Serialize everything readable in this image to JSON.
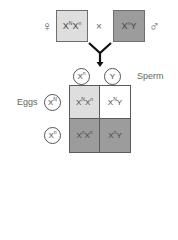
{
  "parents": {
    "female": {
      "symbol": "♀",
      "genotype_base1": "X",
      "genotype_sup1": "N",
      "genotype_base2": "X",
      "genotype_sup2": "n",
      "color": "#dedede"
    },
    "cross_symbol": "×",
    "male": {
      "symbol": "♂",
      "genotype_base1": "X",
      "genotype_sup1": "n",
      "genotype_base2": "Y",
      "color": "#9c9c9c"
    }
  },
  "sperm": {
    "label": "Sperm",
    "gametes": [
      {
        "base": "X",
        "sup": "n"
      },
      {
        "base": "Y",
        "sup": ""
      }
    ]
  },
  "eggs": {
    "label": "Eggs",
    "gametes": [
      {
        "base": "X",
        "sup": "N"
      },
      {
        "base": "X",
        "sup": "n"
      }
    ]
  },
  "punnett": {
    "cells": [
      {
        "b1": "X",
        "s1": "N",
        "b2": "X",
        "s2": "n",
        "color": "#dedede"
      },
      {
        "b1": "X",
        "s1": "N",
        "b2": "Y",
        "s2": "",
        "color": "#ffffff"
      },
      {
        "b1": "X",
        "s1": "n",
        "b2": "X",
        "s2": "n",
        "color": "#9c9c9c"
      },
      {
        "b1": "X",
        "s1": "n",
        "b2": "Y",
        "s2": "",
        "color": "#9c9c9c"
      }
    ]
  }
}
